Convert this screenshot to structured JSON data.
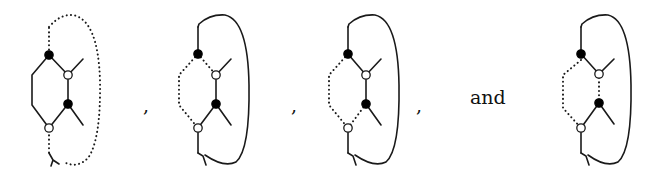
{
  "figure": {
    "separators": [
      ",",
      ",",
      ",",
      "and"
    ],
    "legend": {
      "filled_node": "black vertex",
      "open_node": "white vertex",
      "solid_edge": "edge",
      "dotted_edge": "dotted edge"
    },
    "diagrams": [
      {
        "index": 1,
        "dotted_edges": [
          "top-tail",
          "bottom-tail",
          "outer-loop"
        ],
        "solid_edges": [
          "hexagon",
          "branches"
        ]
      },
      {
        "index": 2,
        "dotted_edges": [
          "left-hexagon-path"
        ],
        "solid_edges": [
          "outer-loop",
          "right-path",
          "branches"
        ]
      },
      {
        "index": 3,
        "dotted_edges": [
          "left-hexagon-path",
          "lower-right-edge"
        ],
        "solid_edges": [
          "outer-loop",
          "upper-right-path",
          "branches"
        ]
      },
      {
        "index": 4,
        "dotted_edges": [
          "left-hexagon-path",
          "middle-vertical-edge"
        ],
        "solid_edges": [
          "outer-loop",
          "diagonals",
          "branches"
        ]
      }
    ]
  }
}
